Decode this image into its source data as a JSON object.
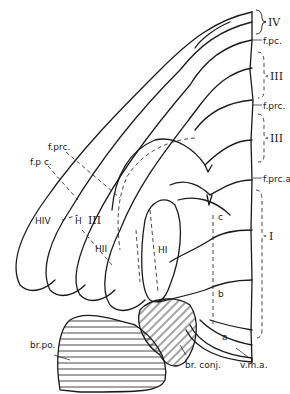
{
  "figure": {
    "type": "anatomical line drawing (hypothalamus / pons region, hatched brachium structures)"
  },
  "labels": {
    "region_IV": "IV",
    "f_pc_top": "f.pc.",
    "region_III_upper": "III",
    "f_prc_right": "f.prc.",
    "region_III_lower": "III",
    "f_prc_a": "f.prc.a",
    "segment_c": "c",
    "region_I": "I",
    "segment_b": "b",
    "segment_a": "a",
    "f_prc_left": "f.prc.",
    "f_pc_left": "f.p c.",
    "HIV": "HIV",
    "H": "H",
    "HIII": "III",
    "HII": "HII",
    "HI": "HI",
    "br_po": "br.po.",
    "br_conj": "br. conj.",
    "v_m_a": "v.m.a."
  }
}
